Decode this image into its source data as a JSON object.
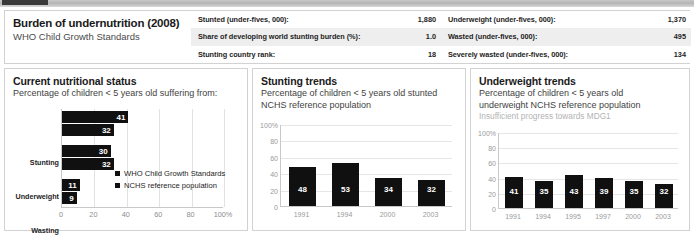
{
  "header": {
    "title": "Burden of undernutrition (2008)",
    "subtitle": "WHO Child Growth Standards",
    "stats_left": [
      {
        "label": "Stunted (under-fives, 000):",
        "value": "1,880"
      },
      {
        "label": "Share of developing world stunting burden (%):",
        "value": "1.0"
      },
      {
        "label": "Stunting country rank:",
        "value": "18"
      }
    ],
    "stats_right": [
      {
        "label": "Underweight (under-fives, 000):",
        "value": "1,370"
      },
      {
        "label": "Wasted (under-fives, 000):",
        "value": "495"
      },
      {
        "label": "Severely wasted (under-fives, 000):",
        "value": "134"
      }
    ]
  },
  "panels": {
    "left": {
      "title": "Current nutritional status",
      "subtitle": "Percentage of children < 5 years old suffering from:"
    },
    "middle": {
      "title": "Stunting trends",
      "subtitle": "Percentage of children < 5 years old stunted",
      "subtitle2": "NCHS reference population"
    },
    "right": {
      "title": "Underweight trends",
      "subtitle": "Percentage of children < 5 years old",
      "subtitle2": "underweight NCHS reference population",
      "note": "Insufficient progress towards MDG1"
    }
  },
  "chart_data": [
    {
      "type": "bar",
      "orientation": "horizontal",
      "title": "Current nutritional status",
      "xlabel": "",
      "ylabel": "",
      "xlim": [
        0,
        100
      ],
      "xticks": [
        "0",
        "20",
        "40",
        "60",
        "80",
        "100%"
      ],
      "xtick_values": [
        0,
        20,
        40,
        60,
        80,
        100
      ],
      "grid": true,
      "categories": [
        "Stunting",
        "Underweight",
        "Wasting"
      ],
      "legend_position": "inside-right",
      "series": [
        {
          "name": "WHO Child Growth Standards",
          "values": [
            41,
            30,
            11
          ]
        },
        {
          "name": "NCHS reference population",
          "values": [
            32,
            32,
            9
          ]
        }
      ]
    },
    {
      "type": "bar",
      "orientation": "vertical",
      "title": "Stunting trends",
      "xlabel": "",
      "ylabel": "",
      "ylim": [
        0,
        100
      ],
      "yticks": [
        "100%",
        "80",
        "60",
        "40",
        "20",
        "0"
      ],
      "ytick_values": [
        100,
        80,
        60,
        40,
        20,
        0
      ],
      "grid": true,
      "categories": [
        "1991",
        "1994",
        "2000",
        "2003"
      ],
      "values": [
        48,
        53,
        34,
        32
      ]
    },
    {
      "type": "bar",
      "orientation": "vertical",
      "title": "Underweight trends",
      "xlabel": "",
      "ylabel": "",
      "ylim": [
        0,
        100
      ],
      "yticks": [
        "100%",
        "80",
        "60",
        "40",
        "20",
        "0"
      ],
      "ytick_values": [
        100,
        80,
        60,
        40,
        20,
        0
      ],
      "grid": true,
      "categories": [
        "1991",
        "1994",
        "1995",
        "1997",
        "2000",
        "2003"
      ],
      "values": [
        41,
        35,
        43,
        39,
        35,
        32
      ]
    }
  ],
  "colors": {
    "bar": "#101010",
    "grid": "#e6e6e6",
    "axis": "#c8c8c8",
    "tick_text": "#9a9a9a",
    "note_text": "#b3b3b3"
  }
}
